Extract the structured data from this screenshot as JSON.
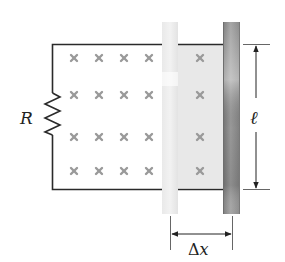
{
  "diagram": {
    "title": "",
    "labels": {
      "resistor": "R",
      "length": "ℓ",
      "displacement_delta": "Δ",
      "displacement_var": "x"
    },
    "field": {
      "symbol": "×",
      "direction": "into page",
      "columns_left": 4,
      "columns_right": 1,
      "rows": 4
    },
    "components": [
      {
        "name": "resistor",
        "label": "R"
      },
      {
        "name": "rail-top"
      },
      {
        "name": "rail-bottom"
      },
      {
        "name": "bar-initial",
        "style": "light"
      },
      {
        "name": "bar-final",
        "style": "dark"
      }
    ],
    "dimensions": [
      {
        "name": "length",
        "label": "ℓ",
        "orientation": "vertical"
      },
      {
        "name": "displacement",
        "label": "Δx",
        "orientation": "horizontal"
      }
    ],
    "colors": {
      "wire": "#2a2a2a",
      "cross": "#9a9a9a",
      "shaded_area": "#e8e8e8",
      "bar_light": "#e6e6e6",
      "bar_dark": "#8f8f8f"
    }
  }
}
